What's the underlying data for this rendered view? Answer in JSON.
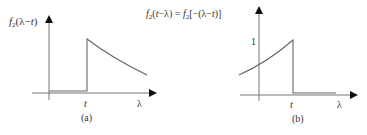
{
  "panels": [
    {
      "id": "a",
      "y_label": "f₂(λ−t)",
      "x_tick": "t",
      "x_axis_label": "λ",
      "caption": "(a)",
      "description": "zero for λ < t, jumps at λ = t, then decays exponentially"
    },
    {
      "id": "b",
      "y_label": "f₂(t−λ) = f₂[−(λ−t)]",
      "y_tick": "1",
      "x_tick": "t",
      "x_axis_label": "λ",
      "caption": "(b)",
      "description": "rises exponentially up to value 1 at λ = t, then zero for λ > t"
    }
  ],
  "colors": {
    "line": "#555555",
    "axis": "#666666",
    "text": "#333333"
  }
}
